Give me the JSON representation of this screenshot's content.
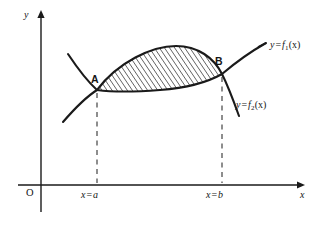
{
  "figure": {
    "type": "math-diagram",
    "background_color": "#ffffff",
    "ink_color": "#1a1a1a"
  },
  "axes": {
    "y_label": "y",
    "x_label": "x",
    "origin_label": "O",
    "x_axis_y_px": 185,
    "y_axis_x_px": 41,
    "x_axis_from_px": 18,
    "x_axis_to_px": 303,
    "y_axis_from_px": 212,
    "y_axis_to_px": 12,
    "arrowheads": [
      "x-right",
      "y-up"
    ]
  },
  "curves": [
    {
      "id": "f1",
      "label_prefix": "y",
      "label_eq": "=",
      "label_fn": "f",
      "label_sub": "1",
      "label_arg": "(x)",
      "label_full": "y = f1(x)",
      "role": "upper-boundary",
      "shape": "rising line through A and B"
    },
    {
      "id": "f2",
      "label_prefix": "y",
      "label_eq": "=",
      "label_fn": "f",
      "label_sub": "2",
      "label_arg": "(x)",
      "label_full": "y = f2(x)",
      "role": "lower-boundary-then-descending",
      "shape": "arc descending from upper left through A, dipping, rising to B, then falling steeply"
    }
  ],
  "points": [
    {
      "id": "A",
      "label": "A",
      "x_px": 97,
      "y_px": 90,
      "meaning": "left intersection of the curves at x = a"
    },
    {
      "id": "B",
      "label": "B",
      "x_px": 222,
      "y_px": 74,
      "meaning": "right intersection of the curves at x = b"
    }
  ],
  "ticks": [
    {
      "id": "a",
      "label_var": "x",
      "label_eq": "=",
      "label_val": "a",
      "label_full": "x = a",
      "x_px": 97
    },
    {
      "id": "b",
      "label_var": "x",
      "label_eq": "=",
      "label_val": "b",
      "label_full": "x = b",
      "x_px": 222
    }
  ],
  "shaded_region": {
    "fill": "hatched",
    "hatch_direction": "rising-to-the-right",
    "hatch_color": "#1a1a1a",
    "between": [
      "f1",
      "f2"
    ],
    "from_label": "x = a",
    "to_label": "x = b"
  },
  "dashed_lines": [
    {
      "id": "dash-a",
      "from_point": "A",
      "to_axis": "x-axis",
      "x_px": 97
    },
    {
      "id": "dash-b",
      "from_point": "B",
      "to_axis": "x-axis",
      "x_px": 222
    }
  ]
}
